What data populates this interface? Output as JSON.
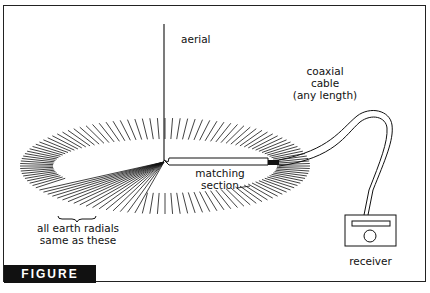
{
  "figure": {
    "caption": "FIGURE 3.20",
    "labels": {
      "aerial": "aerial",
      "cable_line1": "coaxial",
      "cable_line2": "cable",
      "cable_line3": "(any length)",
      "matching_line1": "matching",
      "matching_line2": "section",
      "radials_line1": "all earth radials",
      "radials_line2": "same as these",
      "receiver": "receiver"
    },
    "colors": {
      "ink": "#111111",
      "caption_bg": "#111111",
      "caption_text": "#ffffff"
    }
  }
}
